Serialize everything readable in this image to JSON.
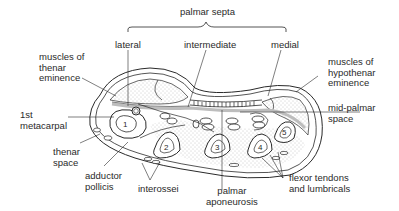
{
  "figure": {
    "labels": {
      "palmar_septa": "palmar septa",
      "lateral": "lateral",
      "intermediate": "intermediate",
      "medial": "medial",
      "thenar_muscles": [
        "muscles of",
        "thenar",
        "eminence"
      ],
      "hypothenar_muscles": [
        "muscles of",
        "hypothenar",
        "eminence"
      ],
      "first_metacarpal": [
        "1st",
        "metacarpal"
      ],
      "mid_palmar_space": [
        "mid-palmar",
        "space"
      ],
      "thenar_space": [
        "thenar",
        "space"
      ],
      "adductor_pollicis": [
        "adductor",
        "pollicis"
      ],
      "interossei": "interossei",
      "palmar_aponeurosis": [
        "palmar",
        "aponeurosis"
      ],
      "flexor_tendons": [
        "flexor tendons",
        "and lumbricals"
      ]
    },
    "bone_numbers": [
      "1",
      "2",
      "3",
      "4",
      "5"
    ],
    "colors": {
      "line": "#2a2a2a",
      "stipple": "#9a9a9a",
      "background": "#ffffff"
    }
  }
}
